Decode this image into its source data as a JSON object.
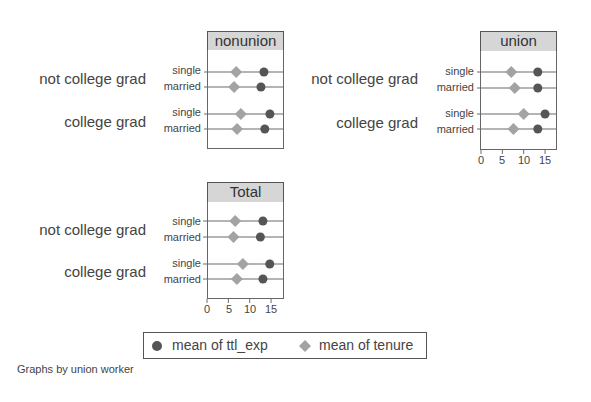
{
  "chart_data": {
    "type": "dot",
    "note": "Graphs by union worker",
    "legend": [
      {
        "name": "mean of ttl_exp",
        "marker": "circle",
        "color": "#555555"
      },
      {
        "name": "mean of tenure",
        "marker": "diamond",
        "color": "#a3a3a3"
      }
    ],
    "groups": [
      "not college grad",
      "college grad"
    ],
    "subgroups": [
      "single",
      "married"
    ],
    "xlim": [
      0,
      18
    ],
    "xticks": [
      0,
      5,
      10,
      15
    ],
    "panels": [
      {
        "title": "nonunion",
        "series": [
          {
            "name": "mean of ttl_exp",
            "values": [
              13.1,
              12.4,
              14.5,
              13.3
            ]
          },
          {
            "name": "mean of tenure",
            "values": [
              6.6,
              6.1,
              7.7,
              6.8
            ]
          }
        ]
      },
      {
        "title": "union",
        "series": [
          {
            "name": "mean of ttl_exp",
            "values": [
              13.3,
              13.3,
              15.0,
              13.3
            ]
          },
          {
            "name": "mean of tenure",
            "values": [
              7.1,
              7.9,
              10.0,
              7.6
            ]
          }
        ]
      },
      {
        "title": "Total",
        "series": [
          {
            "name": "mean of ttl_exp",
            "values": [
              13.1,
              12.5,
              14.7,
              13.1
            ]
          },
          {
            "name": "mean of tenure",
            "values": [
              6.6,
              6.2,
              8.4,
              7.0
            ]
          }
        ]
      }
    ]
  },
  "labels": {
    "group_not_college": "not college grad",
    "group_college": "college grad",
    "single": "single",
    "married": "married",
    "panel_nonunion": "nonunion",
    "panel_union": "union",
    "panel_total": "Total",
    "tick_0": "0",
    "tick_5": "5",
    "tick_10": "10",
    "tick_15": "15",
    "legend_ttl_exp": "mean of ttl_exp",
    "legend_tenure": "mean of tenure",
    "note": "Graphs by union worker"
  }
}
